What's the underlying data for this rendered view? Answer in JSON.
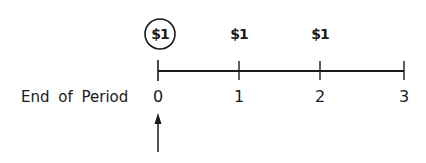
{
  "diagram": {
    "axis_label": "End of Period",
    "periods": [
      {
        "label": "0",
        "x": 158
      },
      {
        "label": "1",
        "x": 239
      },
      {
        "label": "2",
        "x": 320
      },
      {
        "label": "3",
        "x": 404
      }
    ],
    "cash_flows": [
      {
        "label": "$1",
        "period": "0",
        "x": 160,
        "circled": true
      },
      {
        "label": "$1",
        "period": "1",
        "x": 239,
        "circled": false
      },
      {
        "label": "$1",
        "period": "2",
        "x": 320,
        "circled": false
      }
    ],
    "arrow": {
      "points_to_period": "0",
      "direction": "up"
    },
    "colors": {
      "ink": "#1a1a1a",
      "background": "#ffffff"
    }
  }
}
